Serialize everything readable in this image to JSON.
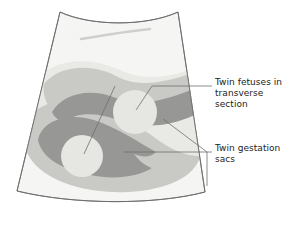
{
  "figure": {
    "type": "medical-illustration",
    "background_color": "#ffffff"
  },
  "scan": {
    "name": "ultrasound-fan-image",
    "outline_color": "#5a5a5a",
    "tones": {
      "fan_background": "#f4f4f2",
      "light_tissue": "#e9e9e5",
      "mid_gray": "#c9c9c6",
      "dark_gray": "#979795",
      "fetus_fill": "#e4e4e0",
      "probe_streak": "#cfcfcc"
    },
    "elements": [
      {
        "name": "gestation-sac-upper",
        "tone": "dark_gray"
      },
      {
        "name": "gestation-sac-lower",
        "tone": "dark_gray"
      },
      {
        "name": "fetus-upper",
        "tone": "fetus_fill"
      },
      {
        "name": "fetus-lower",
        "tone": "fetus_fill"
      }
    ]
  },
  "labels": {
    "fetuses": {
      "text": "Twin fetuses in\ntransverse\nsection",
      "color": "#1c1c1c"
    },
    "sacs": {
      "text": "Twin gestation\nsacs",
      "color": "#1c1c1c"
    }
  },
  "leaders": {
    "color": "#6e6e6e",
    "width": 0.8,
    "lines": [
      {
        "name": "leader-fetus-upper"
      },
      {
        "name": "leader-fetus-lower"
      },
      {
        "name": "leader-sac-upper"
      },
      {
        "name": "leader-sac-lower"
      },
      {
        "name": "leader-bracket-vertical"
      }
    ]
  }
}
